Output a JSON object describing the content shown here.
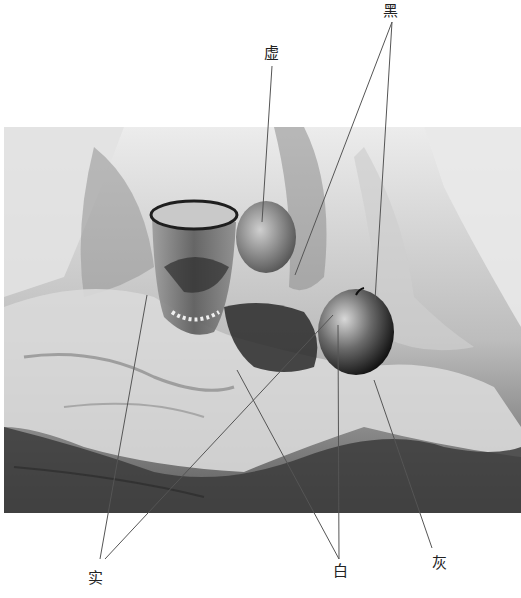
{
  "figure": {
    "labels": {
      "hei": "黑",
      "xu": "虚",
      "shi": "实",
      "bai": "白",
      "hui": "灰"
    },
    "colors": {
      "background": "#ffffff",
      "line": "#555555",
      "dark": "#1a1a1a",
      "mid": "#8a8a8a",
      "light": "#e6e6e6"
    }
  }
}
